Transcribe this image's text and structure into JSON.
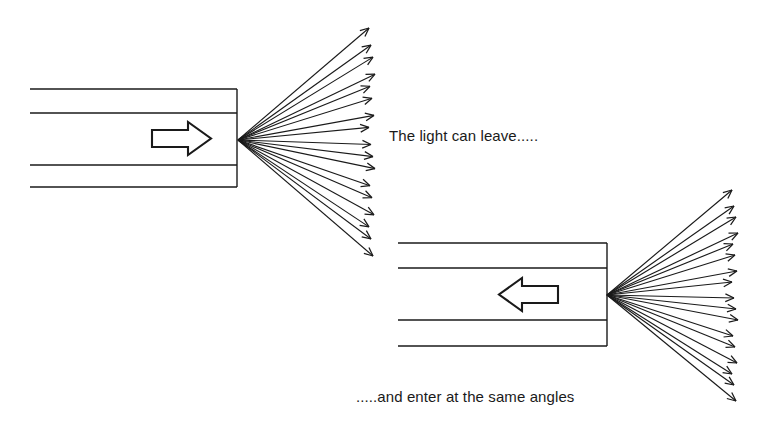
{
  "figure": {
    "background_color": "#ffffff",
    "stroke_color": "#1a1a1a"
  },
  "captions": {
    "leave": "The light can leave.....",
    "enter": ".....and enter at the same angles"
  },
  "chart_data": {
    "type": "diagram",
    "annotations": [
      "The light can leave.....",
      ".....and enter at the same angles"
    ],
    "elements": [
      {
        "name": "top-fibre",
        "kind": "fibre-waveguide",
        "cladding_lines_y": [
          89,
          187
        ],
        "core_lines_y": [
          113,
          165
        ],
        "x_start": 30,
        "x_end": 237,
        "end_face_x": 237,
        "direction_arrow": "right",
        "description": "Light travelling to the right exits the fibre end face"
      },
      {
        "name": "top-ray-fan",
        "kind": "ray-fan",
        "origin": [
          238,
          140
        ],
        "ray_count": 17,
        "arrowhead_end": "outer",
        "fan_top_y": 30,
        "fan_bottom_y": 255,
        "fan_x_end": 372,
        "half_angle_degrees": 59
      },
      {
        "name": "bottom-fibre",
        "kind": "fibre-waveguide",
        "cladding_lines_y": [
          243,
          346
        ],
        "core_lines_y": [
          268,
          320
        ],
        "x_start": 398,
        "x_end": 607,
        "end_face_x": 607,
        "direction_arrow": "left",
        "description": "Light travelling to the left enters the fibre end face"
      },
      {
        "name": "bottom-ray-fan",
        "kind": "ray-fan",
        "origin": [
          607,
          295
        ],
        "ray_count": 17,
        "arrowhead_end": "outer",
        "fan_top_y": 192,
        "fan_bottom_y": 400,
        "fan_x_end": 735,
        "half_angle_degrees": 58
      }
    ]
  },
  "icons": {
    "flow_arrow_right": "block-arrow-right",
    "flow_arrow_left": "block-arrow-left"
  }
}
